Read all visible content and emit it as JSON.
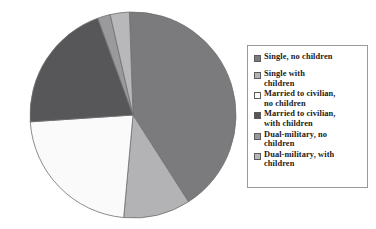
{
  "chart_data": {
    "type": "pie",
    "title": "",
    "subtitle": "",
    "xlabel": "",
    "ylabel": "",
    "grid": false,
    "legend_position": "right",
    "categories": [
      "Single, no children",
      "Single with children",
      "Married to civilian, no children",
      "Married to civilian, with children",
      "Dual-military, no children",
      "Dual-military, with children"
    ],
    "values": [
      41.5,
      10.5,
      22.5,
      20.5,
      2.0,
      3.0
    ],
    "units": "percent",
    "colors": [
      "#7b7b7e",
      "#b3b3b5",
      "#fafafa",
      "#57575a",
      "#9a9a9d",
      "#b8b8ba"
    ],
    "start_angle_deg": -2,
    "direction": "clockwise",
    "slices": [
      {
        "label": "Single, no children",
        "value": 41.5,
        "color": "#7b7b7e"
      },
      {
        "label": "Single with children",
        "value": 10.5,
        "color": "#b3b3b5"
      },
      {
        "label": "Married to civilian, no children",
        "value": 22.5,
        "color": "#fafafa"
      },
      {
        "label": "Married to civilian, with children",
        "value": 20.5,
        "color": "#57575a"
      },
      {
        "label": "Dual-military, no children",
        "value": 2.0,
        "color": "#9a9a9d"
      },
      {
        "label": "Dual-military, with children",
        "value": 3.0,
        "color": "#b8b8ba"
      }
    ],
    "geometry": {
      "cx": 133,
      "cy": 115,
      "r": 103
    }
  },
  "legend": {
    "items": [
      {
        "label": "Single, no children",
        "color": "#7b7b7e",
        "swatch_name": "legend-swatch-single-no-children"
      },
      {
        "label": "Single with\nchildren",
        "color": "#b3b3b5",
        "swatch_name": "legend-swatch-single-with-children"
      },
      {
        "label": "Married to civilian,\nno children",
        "color": "#fafafa",
        "swatch_name": "legend-swatch-married-civilian-no-children"
      },
      {
        "label": "Married to civilian,\nwith children",
        "color": "#57575a",
        "swatch_name": "legend-swatch-married-civilian-with-children"
      },
      {
        "label": "Dual-military, no\nchildren",
        "color": "#9a9a9d",
        "swatch_name": "legend-swatch-dual-military-no-children"
      },
      {
        "label": "Dual-military, with\nchildren",
        "color": "#b8b8ba",
        "swatch_name": "legend-swatch-dual-military-with-children"
      }
    ]
  },
  "style": {
    "background": "#ffffff",
    "slice_outline": "#6e6e6e",
    "legend_border": "#9a9a9a",
    "text_color": "#1b1b1b"
  }
}
